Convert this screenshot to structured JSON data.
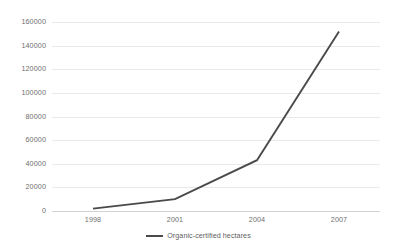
{
  "chart_data": {
    "type": "line",
    "title": "",
    "subtitle": "",
    "xlabel": "",
    "ylabel": "",
    "x": [
      1998,
      2001,
      2004,
      2007
    ],
    "categories": [
      "1998",
      "2001",
      "2004",
      "2007"
    ],
    "series": [
      {
        "name": "Organic-certified hectares",
        "values": [
          2000,
          10000,
          43000,
          152000
        ],
        "color": "#4a4a4a"
      }
    ],
    "ylim": [
      0,
      160000
    ],
    "ytick_step": 20000,
    "yticks": [
      0,
      20000,
      40000,
      60000,
      80000,
      100000,
      120000,
      140000,
      160000
    ],
    "ytick_labels": [
      "0",
      "20000",
      "40000",
      "60000",
      "80000",
      "100000",
      "120000",
      "140000",
      "160000"
    ],
    "xticks": [
      1998,
      2001,
      2004,
      2007
    ],
    "xtick_labels": [
      "1998",
      "2001",
      "2004",
      "2007"
    ],
    "grid": {
      "horizontal": true,
      "vertical": false,
      "color": "#e9e9e9"
    },
    "axis_line_color": "#d2d2d2",
    "legend": {
      "position": "bottom",
      "entries": [
        {
          "label": "Organic-certified hectares",
          "color": "#4a4a4a"
        }
      ]
    }
  },
  "legend": {
    "entry_label": "Organic-certified hectares"
  }
}
